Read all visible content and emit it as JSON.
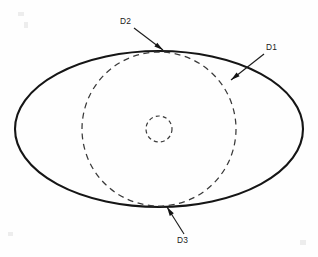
{
  "figure": {
    "background_color": "#fefefe",
    "line_color": "#151515",
    "dash_color": "#3a3a3a",
    "width": 318,
    "height": 257
  },
  "shapes": {
    "outer_ellipse": {
      "name": "outer-ellipse",
      "style": "solid",
      "cx": 159,
      "cy": 129,
      "rx": 144,
      "ry": 78
    },
    "major_dashed_circle": {
      "name": "major-dashed-circle",
      "style": "dashed",
      "cx": 159,
      "cy": 129,
      "r": 77
    },
    "minor_dashed_circle": {
      "name": "minor-dashed-circle",
      "style": "dashed",
      "cx": 159,
      "cy": 129,
      "r": 13
    }
  },
  "callouts": [
    {
      "id": "d2",
      "label": "D2",
      "text_x": 120,
      "text_y": 24,
      "leader_from_x": 134,
      "leader_from_y": 28,
      "leader_to_x": 163,
      "leader_to_y": 50,
      "target": "outer-ellipse-top"
    },
    {
      "id": "d1",
      "label": "D1",
      "text_x": 266,
      "text_y": 50,
      "leader_from_x": 264,
      "leader_from_y": 54,
      "leader_to_x": 231,
      "leader_to_y": 80,
      "target": "major-dashed-circle"
    },
    {
      "id": "d3",
      "label": "D3",
      "text_x": 177,
      "text_y": 243,
      "leader_from_x": 184,
      "leader_from_y": 234,
      "leader_to_x": 167,
      "leader_to_y": 207,
      "target": "outer-ellipse-bottom"
    }
  ]
}
